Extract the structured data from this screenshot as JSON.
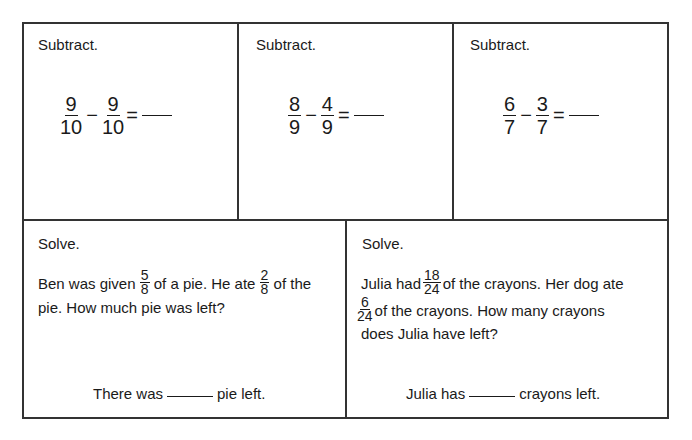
{
  "top_row": [
    {
      "instruction": "Subtract.",
      "a": {
        "num": "9",
        "den": "10"
      },
      "operator": "−",
      "b": {
        "num": "9",
        "den": "10"
      },
      "equals": "="
    },
    {
      "instruction": "Subtract.",
      "a": {
        "num": "8",
        "den": "9"
      },
      "operator": "−",
      "b": {
        "num": "4",
        "den": "9"
      },
      "equals": "="
    },
    {
      "instruction": "Subtract.",
      "a": {
        "num": "6",
        "den": "7"
      },
      "operator": "−",
      "b": {
        "num": "3",
        "den": "7"
      },
      "equals": "="
    }
  ],
  "bottom_row": [
    {
      "instruction": "Solve.",
      "text_1": "Ben was given",
      "frac_1": {
        "num": "5",
        "den": "8"
      },
      "text_2": "of a pie.  He ate",
      "frac_2": {
        "num": "2",
        "den": "8"
      },
      "text_3": "of the",
      "line_2": "pie.  How much pie was left?",
      "answer_prefix": "There was",
      "answer_suffix": "pie left."
    },
    {
      "instruction": "Solve.",
      "text_1": "Julia had",
      "frac_1": {
        "num": "18",
        "den": "24"
      },
      "text_2": "of the crayons.  Her dog ate",
      "frac_2": {
        "num": "6",
        "den": "24"
      },
      "text_3": "of the crayons.  How many crayons",
      "line_3": "does Julia have left?",
      "answer_prefix": "Julia has",
      "answer_suffix": "crayons left."
    }
  ]
}
